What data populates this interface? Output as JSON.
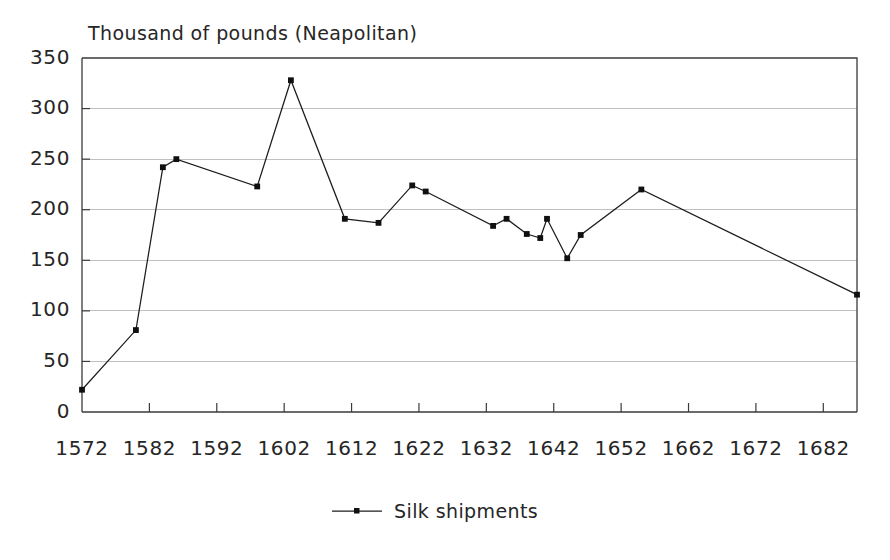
{
  "chart_data": {
    "type": "line",
    "title": "",
    "subtitle": "",
    "ylabel": "Thousand of pounds (Neapolitan)",
    "xlabel": "",
    "legend": [
      "Silk shipments"
    ],
    "legend_position": "bottom-center",
    "grid": true,
    "grid_axis": "y",
    "xlim": [
      1572,
      1687
    ],
    "ylim": [
      0,
      350
    ],
    "yticks": [
      0,
      50,
      100,
      150,
      200,
      250,
      300,
      350
    ],
    "ytick_labels": [
      "0",
      "50",
      "100",
      "150",
      "200",
      "250",
      "300",
      "350"
    ],
    "xticks": [
      1572,
      1582,
      1592,
      1602,
      1612,
      1622,
      1632,
      1642,
      1652,
      1662,
      1672,
      1682
    ],
    "xtick_labels": [
      "1572",
      "1582",
      "1592",
      "1602",
      "1612",
      "1622",
      "1632",
      "1642",
      "1652",
      "1662",
      "1672",
      "1682"
    ],
    "series": [
      {
        "name": "Silk shipments",
        "marker": "square",
        "color": "#1d1d1d",
        "x": [
          1572,
          1580,
          1584,
          1586,
          1598,
          1603,
          1611,
          1616,
          1621,
          1623,
          1633,
          1635,
          1638,
          1640,
          1641,
          1644,
          1646,
          1655,
          1687
        ],
        "values": [
          22,
          81,
          242,
          250,
          223,
          328,
          191,
          187,
          224,
          218,
          184,
          191,
          176,
          172,
          191,
          152,
          175,
          220,
          116
        ]
      }
    ]
  },
  "colors": {
    "background": "#ffffff",
    "axis": "#3a3a3a",
    "grid": "#b9b9b9",
    "series": "#1d1d1d",
    "text": "#262626"
  }
}
